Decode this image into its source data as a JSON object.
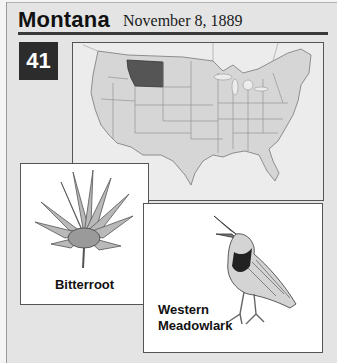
{
  "header": {
    "state_name": "Montana",
    "statehood_date": "November 8, 1889"
  },
  "state_order_number": "41",
  "map": {
    "description": "Map of the contiguous United States with Montana highlighted",
    "highlighted_state": "Montana",
    "highlight_color": "#555555",
    "state_fill_color": "#d6d6d6"
  },
  "state_flower": {
    "label": "Bitterroot"
  },
  "state_bird": {
    "label_line1": "Western",
    "label_line2": "Meadowlark"
  }
}
